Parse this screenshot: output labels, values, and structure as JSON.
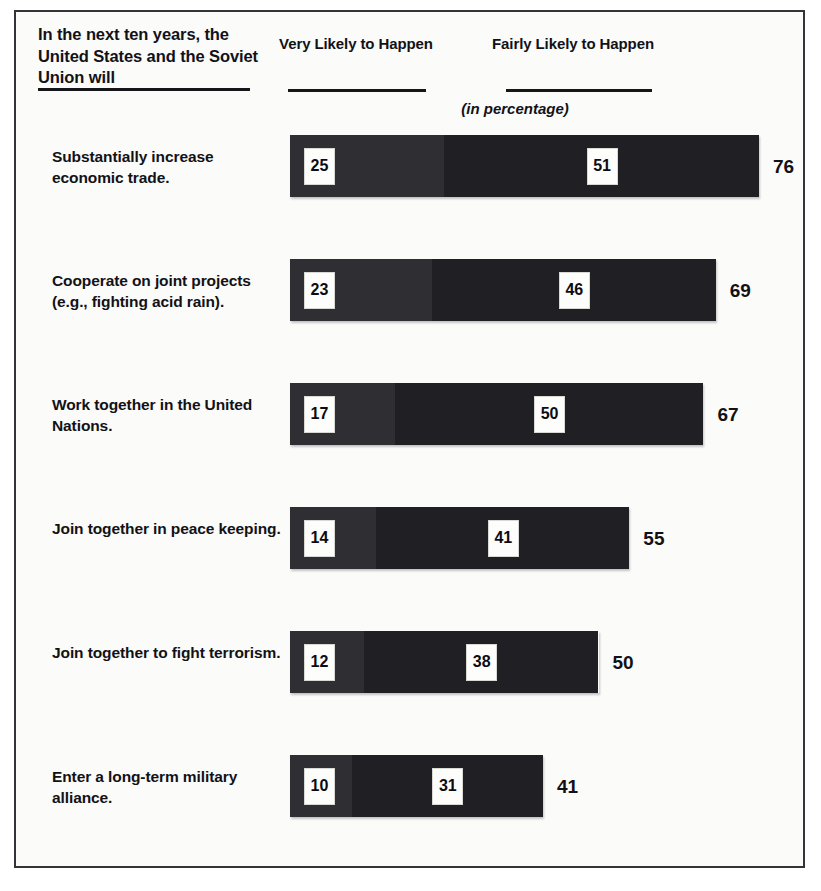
{
  "header": {
    "question_stem": "In the next ten years, the United States and the Soviet Union will",
    "column_very_likely": "Very Likely to Happen",
    "column_fairly_likely": "Fairly Likely to Happen",
    "unit_note": "(in percentage)"
  },
  "colors": {
    "very_likely_segment": "#2e2e33",
    "fairly_likely_segment": "#202024",
    "value_box_background": "#fdfdfc",
    "text": "#121216",
    "frame_border": "#33333a"
  },
  "chart_data": {
    "type": "bar",
    "title": "In the next ten years, the United States and the Soviet Union will",
    "subtitle": "(in percentage)",
    "orientation": "horizontal",
    "stacked": true,
    "xlabel": "",
    "ylabel": "",
    "xlim": [
      0,
      76
    ],
    "grid": false,
    "legend_position": "top",
    "categories": [
      "Substantially increase economic trade.",
      "Cooperate on joint projects (e.g., fighting acid rain).",
      "Work together in the United Nations.",
      "Join together in peace keeping.",
      "Join together to fight terrorism.",
      "Enter a long-term military alliance."
    ],
    "series": [
      {
        "name": "Very Likely to Happen",
        "values": [
          25,
          23,
          17,
          14,
          12,
          10
        ]
      },
      {
        "name": "Fairly Likely to Happen",
        "values": [
          51,
          46,
          50,
          41,
          38,
          31
        ]
      }
    ],
    "totals": [
      76,
      69,
      67,
      55,
      50,
      41
    ]
  },
  "rows": [
    {
      "label": "Substantially increase economic trade.",
      "very": "25",
      "fairly": "51",
      "total": "76"
    },
    {
      "label": "Cooperate on joint projects (e.g., fighting acid rain).",
      "very": "23",
      "fairly": "46",
      "total": "69"
    },
    {
      "label": "Work together in the United Nations.",
      "very": "17",
      "fairly": "50",
      "total": "67"
    },
    {
      "label": "Join together in peace keeping.",
      "very": "14",
      "fairly": "41",
      "total": "55"
    },
    {
      "label": "Join together to fight terrorism.",
      "very": "12",
      "fairly": "38",
      "total": "50"
    },
    {
      "label": "Enter a long-term military alliance.",
      "very": "10",
      "fairly": "31",
      "total": "41"
    }
  ]
}
